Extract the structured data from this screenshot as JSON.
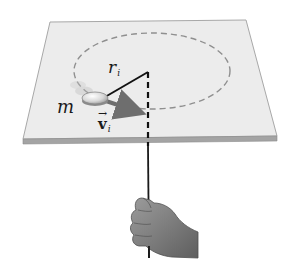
{
  "diagram": {
    "labels": {
      "radius": {
        "main": "r",
        "subscript": "i"
      },
      "mass": "m",
      "velocity": {
        "main": "v",
        "subscript": "i",
        "vector_arrow": "→"
      }
    },
    "colors": {
      "table_surface": "#ececec",
      "table_edge": "#9a9a9a",
      "path_dash": "#8f8f8f",
      "radius_line": "#111111",
      "velocity_arrow": "#6e6e6e",
      "string": "#1a1a1a",
      "hand": "#7a7a7a"
    }
  }
}
